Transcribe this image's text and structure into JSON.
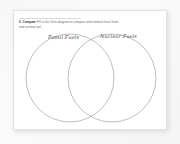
{
  "worksheet": {
    "question": {
      "number": "6.",
      "keyword": "Compare",
      "line1": "Fill in the Venn diagram to compare and contrast fossil fuels",
      "line2": "and nuclear fuel.",
      "full_text": "6. Compare Fill in the Venn diagram to compare and contrast fossil fuels and nuclear fuel."
    },
    "venn_diagram": {
      "left_circle_label": "Fossil Fuels",
      "right_circle_label": "Nuclear Fuels",
      "overlap_label": "",
      "stroke_color": "#8a8a8a"
    },
    "colors": {
      "page_background": "#ffffff",
      "surround_background": "#f6f6f6",
      "text": "#5d5d5d",
      "heading": "#2f2f2f",
      "rule": "#d8d8d8"
    }
  }
}
